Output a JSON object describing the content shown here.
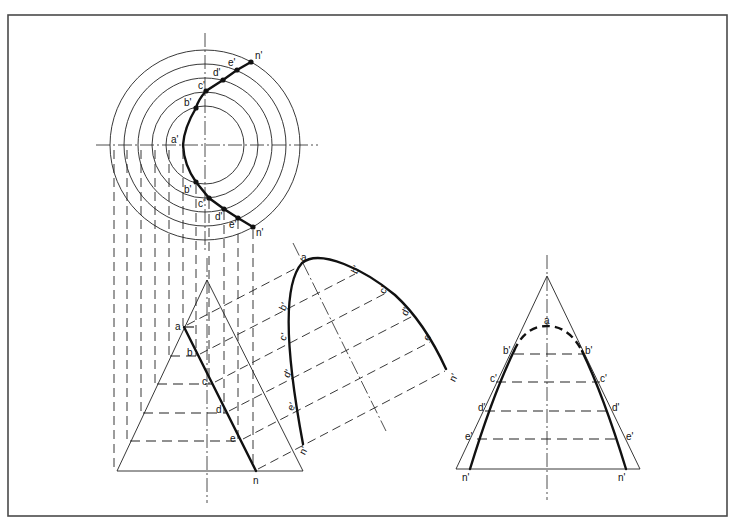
{
  "figure": {
    "frame": {
      "x": 8,
      "y": 15,
      "width": 719,
      "height": 501,
      "color": "#4a4a4a"
    }
  },
  "plan_view": {
    "center": [
      205,
      145
    ],
    "radii": [
      95,
      81,
      67,
      53,
      39,
      26
    ],
    "labels_top": [
      "a'",
      "b'",
      "c'",
      "d'",
      "e'",
      "n'"
    ],
    "labels_bottom": [
      "b'",
      "c'",
      "d'",
      "e'",
      "n'"
    ],
    "points_top": [
      [
        183,
        145
      ],
      [
        196,
        108
      ],
      [
        206,
        91
      ],
      [
        223,
        80
      ],
      [
        237,
        70
      ],
      [
        251,
        62
      ]
    ],
    "points_bottom": [
      [
        196,
        182
      ],
      [
        209,
        198
      ],
      [
        224,
        209
      ],
      [
        238,
        218
      ],
      [
        253,
        227
      ]
    ],
    "projector_x": [
      114,
      127,
      141,
      155,
      169,
      183,
      196,
      209,
      224,
      238,
      253
    ]
  },
  "front_view": {
    "apex": [
      207,
      280
    ],
    "base": {
      "y": 471,
      "x1": 117,
      "x2": 303
    },
    "cut_line_labels": [
      "a",
      "b",
      "c",
      "d",
      "e",
      "n"
    ],
    "cut_points": [
      [
        184,
        327
      ],
      [
        198,
        356
      ],
      [
        213,
        384
      ],
      [
        227,
        413
      ],
      [
        241,
        441
      ],
      [
        256,
        471
      ]
    ],
    "level_y": [
      356,
      384,
      413,
      441
    ]
  },
  "true_shape_view": {
    "labels_left": [
      "b'",
      "c'",
      "d'",
      "e'",
      "n'"
    ],
    "labels_right": [
      "b'",
      "c'",
      "d'",
      "e'",
      "n'"
    ],
    "apex_label": "a"
  },
  "side_view": {
    "apex": [
      547,
      276
    ],
    "base": {
      "y": 469,
      "x1": 456,
      "x2": 640
    },
    "labels_left": [
      "b'",
      "c'",
      "d'",
      "e'",
      "n'"
    ],
    "labels_right": [
      "b'",
      "c'",
      "d'",
      "e'",
      "n'"
    ],
    "apex_label": "a"
  }
}
